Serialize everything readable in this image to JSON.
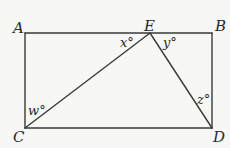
{
  "diagram": {
    "type": "geometry",
    "colors": {
      "background": "#f7f7f5",
      "stroke": "#3a3a3a",
      "text": "#2a2a2a"
    },
    "points": {
      "A": {
        "label": "A",
        "x": 25,
        "y": 33
      },
      "B": {
        "label": "B",
        "x": 212,
        "y": 33
      },
      "C": {
        "label": "C",
        "x": 25,
        "y": 128
      },
      "D": {
        "label": "D",
        "x": 212,
        "y": 128
      },
      "E": {
        "label": "E",
        "x": 150,
        "y": 33
      }
    },
    "segments": [
      {
        "from": "A",
        "to": "B"
      },
      {
        "from": "B",
        "to": "D"
      },
      {
        "from": "D",
        "to": "C"
      },
      {
        "from": "C",
        "to": "A"
      },
      {
        "from": "E",
        "to": "C"
      },
      {
        "from": "E",
        "to": "D"
      }
    ],
    "angles": {
      "w": {
        "label": "w°",
        "at": "C",
        "between": [
          "CA",
          "CE"
        ]
      },
      "x": {
        "label": "x°",
        "at": "E",
        "between": [
          "EA",
          "EC"
        ]
      },
      "y": {
        "label": "y°",
        "at": "E",
        "between": [
          "EB",
          "ED"
        ]
      },
      "z": {
        "label": "z°",
        "at": "D",
        "between": [
          "DB",
          "DE"
        ]
      }
    }
  }
}
